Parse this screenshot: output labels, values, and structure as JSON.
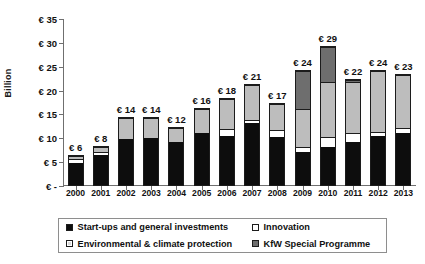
{
  "chart_data": {
    "type": "bar",
    "stacked": true,
    "title": "",
    "xlabel": "",
    "ylabel": "Billion",
    "currency_symbol": "€",
    "ylim": [
      0,
      35
    ],
    "yticks": [
      0,
      5,
      10,
      15,
      20,
      25,
      30,
      35
    ],
    "ytick_labels": [
      "€ -",
      "€ 5",
      "€ 10",
      "€ 15",
      "€ 20",
      "€ 25",
      "€ 30",
      "€ 35"
    ],
    "grid": false,
    "legend_position": "bottom",
    "categories": [
      "2000",
      "2001",
      "2002",
      "2003",
      "2004",
      "2005",
      "2006",
      "2007",
      "2008",
      "2009",
      "2010",
      "2011",
      "2012",
      "2013"
    ],
    "series": [
      {
        "name": "Start-ups and general investments",
        "color": "#0d0d0d",
        "values": [
          4.7,
          6.2,
          9.7,
          9.8,
          9.0,
          10.8,
          10.3,
          13.0,
          10.0,
          7.0,
          8.0,
          9.0,
          10.2,
          11.0
        ]
      },
      {
        "name": "Innovation",
        "color": "#ffffff",
        "values": [
          0.7,
          0.7,
          0.0,
          0.0,
          0.0,
          0.0,
          1.4,
          0.7,
          1.5,
          1.0,
          2.0,
          2.0,
          1.0,
          1.0
        ]
      },
      {
        "name": "Environmental & climate protection",
        "color": "#bdbdbd",
        "values": [
          0.6,
          1.1,
          4.3,
          4.2,
          3.0,
          5.2,
          6.3,
          7.3,
          5.5,
          8.0,
          11.5,
          10.5,
          12.8,
          11.0
        ]
      },
      {
        "name": "KfW Special Programme",
        "color": "#6e6e6e",
        "values": [
          0.0,
          0.0,
          0.0,
          0.0,
          0.0,
          0.0,
          0.0,
          0.0,
          0.0,
          8.0,
          7.5,
          0.5,
          0.0,
          0.0
        ]
      }
    ],
    "totals": [
      6,
      8,
      14,
      14,
      12,
      16,
      18,
      21,
      17,
      24,
      29,
      22,
      24,
      23
    ],
    "total_labels": [
      "€ 6",
      "€ 8",
      "€ 14",
      "€ 14",
      "€ 12",
      "€ 16",
      "€ 18",
      "€ 21",
      "€ 17",
      "€ 24",
      "€ 29",
      "€ 22",
      "€ 24",
      "€ 23"
    ]
  },
  "legend": {
    "items": [
      {
        "label": "Start-ups and general investments",
        "swatch": "sw-startups"
      },
      {
        "label": "Innovation",
        "swatch": "sw-innovation"
      },
      {
        "label": "Environmental & climate protection",
        "swatch": "sw-environment"
      },
      {
        "label": "KfW Special Programme",
        "swatch": "sw-kfw"
      }
    ]
  },
  "axis": {
    "y_title": "Billion"
  }
}
